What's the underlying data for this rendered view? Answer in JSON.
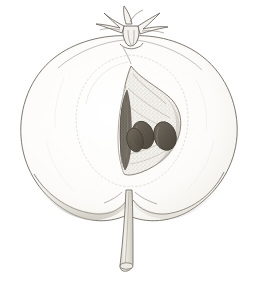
{
  "artwork": {
    "title": "Quince fruit, longitudinal section",
    "medium": "graphite pencil drawing",
    "subject": "pome fruit cut in half showing seed chamber",
    "caption": "",
    "background_color": "#ffffff",
    "canvas": {
      "width": 261,
      "height": 286
    }
  },
  "palette": {
    "outline": "#6b6559",
    "outline_light": "#9a958c",
    "hatch": "#b3aea4",
    "flesh_tint": "#f7f6f3",
    "core_tint": "#eceae4",
    "seed_fill": "#5d564b",
    "seed_dark": "#3f3930",
    "seed_highlight": "#8d8678",
    "stem_fill": "#e8e5de",
    "stem_outline": "#7a7368",
    "calyx_outline": "#6f6a60"
  },
  "parts": [
    {
      "id": "calyx",
      "label": "Calyx with dried sepals",
      "position": "top center",
      "note": "spiky radiating sepal remnants at the apex of the fruit"
    },
    {
      "id": "fruit-body",
      "label": "Fruit body, halved",
      "position": "center",
      "note": "broad heart shaped outline with two rounded lower lobes"
    },
    {
      "id": "core-boundary",
      "label": "Faint inner core line",
      "position": "center",
      "note": "soft elliptical line enclosing the core region"
    },
    {
      "id": "seed-chamber",
      "label": "Seed chamber",
      "position": "center",
      "note": "leaf shaped locule drawn with dense stippling"
    },
    {
      "id": "seed-sliver",
      "label": "Narrow empty locule",
      "position": "left of seed chamber",
      "note": "slim vertical pointed cavity"
    },
    {
      "id": "seeds",
      "label": "Seeds",
      "position": "inside seed chamber",
      "count": 3,
      "note": "three dark ovoid pips angled to the right"
    },
    {
      "id": "stem",
      "label": "Stem / peduncle",
      "position": "bottom center",
      "note": "long tapering stalk descending from the basal notch"
    },
    {
      "id": "lobe-shading",
      "label": "Shading under left lobe",
      "position": "lower left",
      "note": "soft graphite band following the lower contour"
    }
  ],
  "annotations": {
    "seed_count_label": "3",
    "section_label": "",
    "scale_label": ""
  }
}
